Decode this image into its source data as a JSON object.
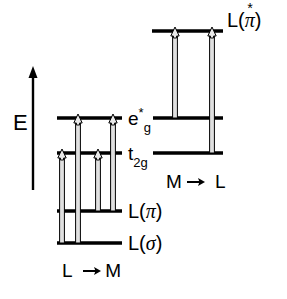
{
  "figure": {
    "type": "energy-level-diagram",
    "title": "",
    "background_color": "#ffffff",
    "line_color": "#000000",
    "arrow_fill_color": "#d9d9d9"
  },
  "axis": {
    "label": "E",
    "direction": "up",
    "name": "energy-axis"
  },
  "left_block": {
    "transition_label": "L -> M",
    "levels": [
      {
        "key": "eg_star",
        "label_main": "e",
        "label_sup": "*",
        "label_sub": "g",
        "y": 118,
        "x1": 57,
        "x2": 122
      },
      {
        "key": "t2g",
        "label_main": "t",
        "label_sup": "",
        "label_sub": "2g",
        "y": 153,
        "x1": 57,
        "x2": 122
      },
      {
        "key": "l_pi",
        "label_main": "L(",
        "greek": "π",
        "label_close": ")",
        "y": 211,
        "x1": 57,
        "x2": 122
      },
      {
        "key": "l_sigma",
        "label_main": "L(",
        "greek": "σ",
        "label_close": ")",
        "y": 243,
        "x1": 57,
        "x2": 122
      }
    ],
    "arrows": [
      {
        "name": "sigma-to-t2g",
        "x": 62,
        "from_y": 243,
        "to_y": 153
      },
      {
        "name": "sigma-to-eg-star",
        "x": 78,
        "from_y": 243,
        "to_y": 118
      },
      {
        "name": "pi-to-t2g",
        "x": 98,
        "from_y": 211,
        "to_y": 153
      },
      {
        "name": "pi-to-eg-star",
        "x": 113,
        "from_y": 211,
        "to_y": 118
      }
    ]
  },
  "right_block": {
    "transition_label": "M -> L",
    "levels": [
      {
        "key": "l_pi_star",
        "label_main": "L(",
        "greek": "π",
        "label_sup": "*",
        "label_close": ")",
        "y": 31,
        "x1": 152,
        "x2": 223
      },
      {
        "key": "eg_star_r",
        "key_ref": "eg_star",
        "y": 118,
        "x1": 153,
        "x2": 223
      },
      {
        "key": "t2g_r",
        "key_ref": "t2g",
        "y": 153,
        "x1": 153,
        "x2": 223
      }
    ],
    "arrows": [
      {
        "name": "eg-star-to-l-pi-star",
        "x": 175,
        "from_y": 118,
        "to_y": 31
      },
      {
        "name": "t2g-to-l-pi-star",
        "x": 212,
        "from_y": 153,
        "to_y": 31
      }
    ]
  },
  "labels": {
    "l_pi_star_text": "L(π)",
    "eg_star_text": "e",
    "t2g_text": "t",
    "l_pi_text": "L(π)",
    "l_sigma_text": "L(σ)",
    "left_transition": "L -> M",
    "right_transition": "M -> L",
    "energy": "E",
    "star": "*",
    "g_sub": "g",
    "two_g_sub": "2g",
    "L_open": "L(",
    "paren_close": ")",
    "pi": "π",
    "sigma": "σ"
  }
}
